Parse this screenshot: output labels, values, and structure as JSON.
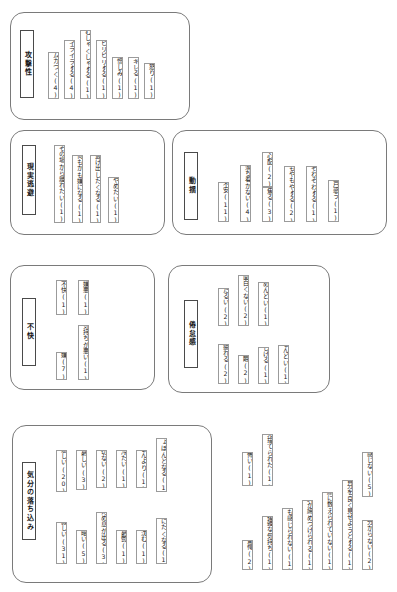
{
  "diagram": {
    "groups": [
      {
        "id": "aggression",
        "header": "攻撃性",
        "header_box": {
          "x": 20,
          "y": 30,
          "w": 14,
          "h": 68
        },
        "box": {
          "x": 10,
          "y": 12,
          "w": 180,
          "h": 108
        },
        "items": [
          {
            "label": "ムカつく(4)",
            "x": 48,
            "y": 52,
            "w": 11,
            "h": 47
          },
          {
            "label": "イライラする(4)",
            "x": 64,
            "y": 40,
            "w": 11,
            "h": 59
          },
          {
            "label": "むしゃくしゃする(1)",
            "x": 80,
            "y": 30,
            "w": 11,
            "h": 69
          },
          {
            "label": "ピリピリする(1)",
            "x": 96,
            "y": 40,
            "w": 11,
            "h": 59
          },
          {
            "label": "憎しみ(1)",
            "x": 112,
            "y": 57,
            "w": 11,
            "h": 42
          },
          {
            "label": "キレる(1)",
            "x": 128,
            "y": 57,
            "w": 11,
            "h": 42
          },
          {
            "label": "怒り(1)",
            "x": 144,
            "y": 63,
            "w": 11,
            "h": 36
          }
        ]
      },
      {
        "id": "escapism",
        "header": "現実逃避",
        "header_box": {
          "x": 22,
          "y": 145,
          "w": 14,
          "h": 70
        },
        "box": {
          "x": 10,
          "y": 130,
          "w": 155,
          "h": 105
        },
        "items": [
          {
            "label": "その場から離れたい(1)",
            "x": 54,
            "y": 145,
            "w": 11,
            "h": 78
          },
          {
            "label": "何もかも嫌になる(1)",
            "x": 72,
            "y": 155,
            "w": 11,
            "h": 68
          },
          {
            "label": "逃げ出したくなる(1)",
            "x": 90,
            "y": 155,
            "w": 11,
            "h": 68
          },
          {
            "label": "やめたい(1)",
            "x": 108,
            "y": 177,
            "w": 11,
            "h": 46
          }
        ]
      },
      {
        "id": "agitation",
        "header": "動揺",
        "header_box": {
          "x": 184,
          "y": 152,
          "w": 14,
          "h": 68
        },
        "box": {
          "x": 172,
          "y": 130,
          "w": 215,
          "h": 105
        },
        "items": [
          {
            "label": "不安(11)",
            "x": 218,
            "y": 182,
            "w": 11,
            "h": 40
          },
          {
            "label": "落ち着かない(4)",
            "x": 240,
            "y": 165,
            "w": 11,
            "h": 57
          },
          {
            "label": "心配(2)",
            "x": 262,
            "y": 152,
            "w": 11,
            "h": 35
          },
          {
            "label": "焦る(3)",
            "x": 262,
            "y": 187,
            "w": 11,
            "h": 35
          },
          {
            "label": "もやもやする(2)",
            "x": 284,
            "y": 166,
            "w": 11,
            "h": 56
          },
          {
            "label": "そわそわする(1)",
            "x": 306,
            "y": 166,
            "w": 11,
            "h": 56
          },
          {
            "label": "戸惑う(1)",
            "x": 328,
            "y": 180,
            "w": 11,
            "h": 42
          }
        ]
      },
      {
        "id": "discomfort",
        "header": "不快",
        "header_box": {
          "x": 22,
          "y": 298,
          "w": 14,
          "h": 68
        },
        "box": {
          "x": 10,
          "y": 265,
          "w": 145,
          "h": 125
        },
        "items": [
          {
            "label": "不快(1)",
            "x": 56,
            "y": 280,
            "w": 11,
            "h": 35
          },
          {
            "label": "嫌悪(1)",
            "x": 78,
            "y": 280,
            "w": 11,
            "h": 35
          },
          {
            "label": "嫌(7)",
            "x": 56,
            "y": 352,
            "w": 11,
            "h": 28
          },
          {
            "label": "気持ちが悪い(1)",
            "x": 78,
            "y": 325,
            "w": 11,
            "h": 55
          }
        ]
      },
      {
        "id": "lethargy",
        "header": "倦怠感",
        "header_box": {
          "x": 184,
          "y": 300,
          "w": 14,
          "h": 68
        },
        "box": {
          "x": 168,
          "y": 265,
          "w": 162,
          "h": 128
        },
        "items": [
          {
            "label": "だるい(2)",
            "x": 218,
            "y": 288,
            "w": 11,
            "h": 38
          },
          {
            "label": "面白くない(2)",
            "x": 238,
            "y": 275,
            "w": 11,
            "h": 51
          },
          {
            "label": "めんどい(1)",
            "x": 258,
            "y": 282,
            "w": 11,
            "h": 44
          },
          {
            "label": "疲れる(2)",
            "x": 218,
            "y": 344,
            "w": 11,
            "h": 40
          },
          {
            "label": "眠(2)",
            "x": 238,
            "y": 355,
            "w": 11,
            "h": 29
          },
          {
            "label": "しける(1)",
            "x": 258,
            "y": 347,
            "w": 11,
            "h": 37
          },
          {
            "label": "しんどい(1)",
            "x": 278,
            "y": 345,
            "w": 11,
            "h": 39
          }
        ]
      },
      {
        "id": "depressed-mood",
        "header": "気分の落ち込み",
        "header_box": {
          "x": 22,
          "y": 462,
          "w": 14,
          "h": 78
        },
        "box": {
          "x": 12,
          "y": 425,
          "w": 200,
          "h": 158
        },
        "items": [
          {
            "label": "悲しい(20)",
            "x": 56,
            "y": 450,
            "w": 11,
            "h": 42
          },
          {
            "label": "憂しい(3)",
            "x": 76,
            "y": 450,
            "w": 11,
            "h": 40
          },
          {
            "label": "切ない(2)",
            "x": 96,
            "y": 450,
            "w": 11,
            "h": 38
          },
          {
            "label": "冷たい(1)",
            "x": 116,
            "y": 450,
            "w": 11,
            "h": 38
          },
          {
            "label": "どんより(1)",
            "x": 136,
            "y": 450,
            "w": 11,
            "h": 38
          },
          {
            "label": "しょぼんとなる(1)",
            "x": 156,
            "y": 438,
            "w": 11,
            "h": 54
          },
          {
            "label": "寂しい(31)",
            "x": 56,
            "y": 522,
            "w": 11,
            "h": 42
          },
          {
            "label": "暗い(5)",
            "x": 76,
            "y": 530,
            "w": 11,
            "h": 34
          },
          {
            "label": "ため息が出る(3)",
            "x": 96,
            "y": 512,
            "w": 11,
            "h": 52
          },
          {
            "label": "憂鬱(1)",
            "x": 116,
            "y": 530,
            "w": 11,
            "h": 34
          },
          {
            "label": "沈む(1)",
            "x": 136,
            "y": 530,
            "w": 11,
            "h": 34
          },
          {
            "label": "死にたくなる(1)",
            "x": 156,
            "y": 518,
            "w": 11,
            "h": 46
          }
        ]
      },
      {
        "id": "misc",
        "header": "",
        "header_box": null,
        "box": null,
        "items": [
          {
            "label": "怖い(1)",
            "x": 242,
            "y": 452,
            "w": 11,
            "h": 34
          },
          {
            "label": "見捨てられた(1)",
            "x": 262,
            "y": 434,
            "w": 11,
            "h": 52
          },
          {
            "label": "驚愕(2)",
            "x": 242,
            "y": 540,
            "w": 11,
            "h": 30
          },
          {
            "label": "複雑な気持ち(1)",
            "x": 262,
            "y": 516,
            "w": 11,
            "h": 54
          },
          {
            "label": "何も感じられない(1)",
            "x": 282,
            "y": 508,
            "w": 11,
            "h": 62
          },
          {
            "label": "胸が締めつけられる(1)",
            "x": 302,
            "y": 500,
            "w": 11,
            "h": 70
          },
          {
            "label": "顔に数えられていない(1)",
            "x": 322,
            "y": 492,
            "w": 11,
            "h": 78
          },
          {
            "label": "自分を良く見せようとする(1)",
            "x": 342,
            "y": 480,
            "w": 11,
            "h": 90
          },
          {
            "label": "分からない(2)",
            "x": 362,
            "y": 520,
            "w": 11,
            "h": 50
          },
          {
            "label": "感じない(5)",
            "x": 362,
            "y": 452,
            "w": 11,
            "h": 45
          }
        ]
      }
    ]
  }
}
